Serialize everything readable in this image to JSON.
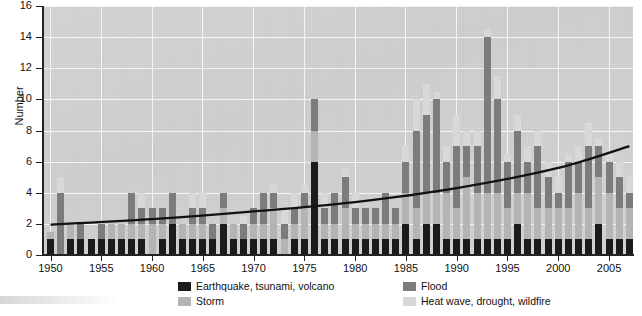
{
  "chart_data": {
    "type": "bar",
    "title": "",
    "xlabel": "",
    "ylabel": "Number",
    "ylim": [
      0,
      16
    ],
    "ytick_step": 2,
    "yticks": [
      0,
      2,
      4,
      6,
      8,
      10,
      12,
      14,
      16
    ],
    "xlim": [
      1950,
      2007
    ],
    "xticks": [
      1950,
      1955,
      1960,
      1965,
      1970,
      1975,
      1980,
      1985,
      1990,
      1995,
      2000,
      2005
    ],
    "grid": true,
    "stacked": true,
    "legend_position": "below-plot",
    "categories": [
      1950,
      1951,
      1952,
      1953,
      1954,
      1955,
      1956,
      1957,
      1958,
      1959,
      1960,
      1961,
      1962,
      1963,
      1964,
      1965,
      1966,
      1967,
      1968,
      1969,
      1970,
      1971,
      1972,
      1973,
      1974,
      1975,
      1976,
      1977,
      1978,
      1979,
      1980,
      1981,
      1982,
      1983,
      1984,
      1985,
      1986,
      1987,
      1988,
      1989,
      1990,
      1991,
      1992,
      1993,
      1994,
      1995,
      1996,
      1997,
      1998,
      1999,
      2000,
      2001,
      2002,
      2003,
      2004,
      2005,
      2006,
      2007
    ],
    "series": [
      {
        "name": "Earthquake, tsunami, volcano",
        "color": "#1b1b1b",
        "values": [
          1,
          0,
          1,
          1,
          1,
          1,
          1,
          1,
          1,
          1,
          0,
          1,
          2,
          1,
          1,
          1,
          1,
          2,
          1,
          1,
          1,
          1,
          1,
          0,
          1,
          1,
          6,
          1,
          1,
          1,
          1,
          1,
          1,
          1,
          1,
          2,
          1,
          2,
          2,
          1,
          1,
          1,
          1,
          1,
          1,
          1,
          2,
          1,
          1,
          1,
          1,
          1,
          1,
          1,
          2,
          1,
          1,
          1
        ]
      },
      {
        "name": "Storm",
        "color": "#b4b4b4",
        "values": [
          0.5,
          0,
          1,
          0,
          0,
          0,
          1,
          1,
          1,
          1,
          2,
          1,
          0,
          1,
          1,
          1,
          0,
          1,
          1,
          0,
          1,
          1,
          2,
          1,
          1,
          2,
          2,
          1,
          1,
          2,
          1,
          1,
          1,
          1,
          1,
          2,
          2,
          2,
          2,
          3,
          2,
          4,
          3,
          3,
          3,
          2,
          2,
          3,
          2,
          2,
          2,
          2,
          3,
          2,
          3,
          3,
          2,
          2
        ]
      },
      {
        "name": "Flood",
        "color": "#7c7c7c",
        "values": [
          0,
          4,
          0,
          1,
          0,
          1,
          0,
          0,
          2,
          1,
          1,
          1,
          2,
          0,
          1,
          1,
          1,
          1,
          0,
          1,
          1,
          2,
          1,
          1,
          1,
          1,
          2,
          1,
          2,
          2,
          1,
          1,
          1,
          2,
          1,
          2,
          5,
          5,
          6,
          2,
          4,
          2,
          3,
          10,
          6,
          3,
          4,
          2,
          4,
          2,
          1,
          3,
          2,
          4,
          2,
          2,
          2,
          1
        ]
      },
      {
        "name": "Heat wave, drought, wildfire",
        "color": "#d8d8d8",
        "values": [
          0,
          1,
          0,
          0,
          0,
          0,
          0,
          0,
          0,
          1,
          0,
          0,
          0,
          0,
          1,
          1,
          0,
          0,
          0,
          0.5,
          0,
          0,
          0.5,
          1,
          1,
          0.5,
          0,
          1,
          0,
          0.5,
          1,
          0,
          0,
          0,
          0,
          1,
          2,
          2,
          0.5,
          1,
          2,
          1,
          1,
          0.5,
          1.5,
          0.5,
          1,
          1,
          1,
          1,
          1,
          0.5,
          1,
          1.5,
          0.5,
          0.5,
          1,
          1
        ]
      }
    ],
    "trendline": {
      "name": "trend",
      "color": "#111111",
      "type": "smooth-increasing",
      "start": {
        "x": 1950,
        "y": 1.95
      },
      "end": {
        "x": 2007,
        "y": 7.0
      },
      "points": [
        {
          "x": 1950,
          "y": 1.95
        },
        {
          "x": 1960,
          "y": 2.3
        },
        {
          "x": 1970,
          "y": 2.8
        },
        {
          "x": 1980,
          "y": 3.4
        },
        {
          "x": 1990,
          "y": 4.3
        },
        {
          "x": 2000,
          "y": 5.6
        },
        {
          "x": 2007,
          "y": 7.0
        }
      ]
    },
    "legend": [
      {
        "label": "Earthquake, tsunami, volcano",
        "color": "#1b1b1b"
      },
      {
        "label": "Storm",
        "color": "#b4b4b4"
      },
      {
        "label": "Flood",
        "color": "#7c7c7c"
      },
      {
        "label": "Heat wave, drought, wildfire",
        "color": "#d8d8d8"
      }
    ]
  },
  "axis": {
    "y_title": "Number",
    "y_tick_labels": [
      "0",
      "2",
      "4",
      "6",
      "8",
      "10",
      "12",
      "14",
      "16"
    ],
    "x_tick_labels": [
      "1950",
      "1955",
      "1960",
      "1965",
      "1970",
      "1975",
      "1980",
      "1985",
      "1990",
      "1995",
      "2000",
      "2005"
    ]
  },
  "legend": {
    "items": [
      {
        "label": "Earthquake, tsunami, volcano"
      },
      {
        "label": "Storm"
      },
      {
        "label": "Flood"
      },
      {
        "label": "Heat wave, drought, wildfire"
      }
    ]
  }
}
